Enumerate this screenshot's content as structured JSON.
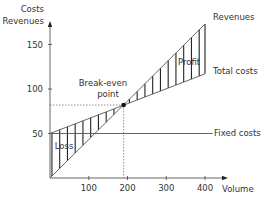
{
  "chart_data": {
    "type": "line",
    "title": "",
    "xlabel": "Volume",
    "ylabel_lines": [
      "Costs",
      "Revenues"
    ],
    "xlim": [
      0,
      450
    ],
    "ylim": [
      0,
      180
    ],
    "x_ticks": [
      100,
      200,
      300,
      400
    ],
    "x_tick_labels": [
      "100",
      "200",
      "300",
      "400"
    ],
    "y_ticks": [
      50,
      100,
      150
    ],
    "y_tick_labels": [
      "50",
      "100",
      "150"
    ],
    "grid": false,
    "series": [
      {
        "name": "Revenues",
        "x": [
          0,
          400
        ],
        "y": [
          0,
          173
        ]
      },
      {
        "name": "Total costs",
        "x": [
          0,
          400
        ],
        "y": [
          50,
          117
        ]
      },
      {
        "name": "Fixed costs",
        "x": [
          0,
          420
        ],
        "y": [
          50,
          50
        ]
      }
    ],
    "break_even": {
      "x": 190,
      "y": 82
    },
    "annotations": {
      "break_even_line1": "Break-even",
      "break_even_line2": "point",
      "profit": "Profit",
      "loss": "Loss",
      "revenues": "Revenues",
      "total_costs": "Total costs",
      "fixed_costs": "Fixed costs"
    },
    "hatch_step": 20
  }
}
